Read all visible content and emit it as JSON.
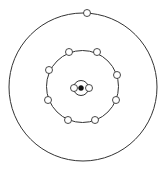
{
  "diagram": {
    "type": "bohr-atom-model",
    "colors": {
      "background": "#ffffff",
      "line": "#333333",
      "electron_fill": "#ffffff",
      "nucleus_fill": "#111111"
    },
    "nucleus": {
      "cx": 81,
      "cy": 88,
      "r": 2.5
    },
    "shells": [
      {
        "name": "inner-shell",
        "electron_count": 2,
        "cx": 81,
        "cy": 88,
        "r": 7.5,
        "electrons": [
          {
            "cx": 74,
            "cy": 88
          },
          {
            "cx": 89,
            "cy": 88
          }
        ]
      },
      {
        "name": "middle-shell",
        "electron_count": 8,
        "cx": 82.5,
        "cy": 86.5,
        "r": 36,
        "electrons": [
          {
            "cx": 69,
            "cy": 52
          },
          {
            "cx": 97,
            "cy": 52
          },
          {
            "cx": 49,
            "cy": 70
          },
          {
            "cx": 117,
            "cy": 75
          },
          {
            "cx": 48,
            "cy": 100
          },
          {
            "cx": 116,
            "cy": 100
          },
          {
            "cx": 68,
            "cy": 120
          },
          {
            "cx": 95,
            "cy": 120
          }
        ]
      },
      {
        "name": "outer-shell",
        "electron_count": 1,
        "cx": 83,
        "cy": 87,
        "r": 74,
        "electrons": [
          {
            "cx": 87,
            "cy": 13
          }
        ]
      }
    ],
    "electron_radius": 3.5
  }
}
